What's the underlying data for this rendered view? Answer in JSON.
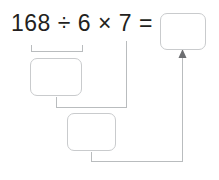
{
  "worksheet": {
    "type": "order-of-operations-flow-diagram",
    "equation": {
      "full_text": "168 ÷ 6 × 7 =",
      "terms": [
        {
          "kind": "number",
          "text": "168"
        },
        {
          "kind": "operator",
          "text": "÷"
        },
        {
          "kind": "number",
          "text": "6"
        },
        {
          "kind": "operator",
          "text": "×"
        },
        {
          "kind": "number",
          "text": "7"
        },
        {
          "kind": "operator",
          "text": "="
        }
      ]
    },
    "boxes": [
      {
        "id": "quotient",
        "value": "",
        "placeholder": "",
        "label": "first-step-answer-box"
      },
      {
        "id": "product",
        "value": "",
        "placeholder": "",
        "label": "second-step-answer-box"
      },
      {
        "id": "result",
        "value": "",
        "placeholder": "",
        "label": "final-answer-box"
      }
    ],
    "annotations": {
      "bracket_spans": "168 ÷ 6",
      "arrow_target": "final-answer-box"
    },
    "colors": {
      "text": "#231f20",
      "box_border": "#c9cbcd",
      "connector": "#b9bcbe",
      "arrowhead": "#6d6e71",
      "background": "#ffffff"
    }
  }
}
